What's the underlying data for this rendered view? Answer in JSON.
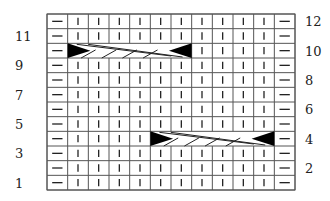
{
  "chart": {
    "title": "",
    "columns": 12,
    "rows": 12,
    "grid": {
      "left": 47,
      "top": 14,
      "right": 295,
      "bottom": 190
    },
    "colors": {
      "line": "#555555",
      "symbol": "#222222",
      "fill": "#000000",
      "background": "#ffffff"
    },
    "symbols": {
      "dash": "purl (horizontal dash)",
      "bar": "knit (vertical bar)",
      "cable": "cable cross"
    },
    "column_pattern": [
      "dash",
      "bar",
      "bar",
      "bar",
      "bar",
      "bar",
      "bar",
      "bar",
      "bar",
      "bar",
      "bar",
      "dash"
    ],
    "left_labels": [
      "1",
      "3",
      "5",
      "7",
      "9",
      "11"
    ],
    "right_labels": [
      "2",
      "4",
      "6",
      "8",
      "10",
      "12"
    ],
    "cables": [
      {
        "row": 10,
        "start_col": 2,
        "end_col": 7,
        "direction": "left-over-right"
      },
      {
        "row": 4,
        "start_col": 6,
        "end_col": 11,
        "direction": "left-over-right"
      }
    ]
  },
  "chart_data": {
    "type": "table",
    "xlabel": "",
    "ylabel": "Row",
    "row_labels_left": [
      1,
      3,
      5,
      7,
      9,
      11
    ],
    "row_labels_right": [
      2,
      4,
      6,
      8,
      10,
      12
    ],
    "rows": [
      {
        "row": 12,
        "cells": [
          "—",
          "|",
          "|",
          "|",
          "|",
          "|",
          "|",
          "|",
          "|",
          "|",
          "|",
          "—"
        ]
      },
      {
        "row": 11,
        "cells": [
          "—",
          "|",
          "|",
          "|",
          "|",
          "|",
          "|",
          "|",
          "|",
          "|",
          "|",
          "—"
        ]
      },
      {
        "row": 10,
        "cells": [
          "—",
          "cable6",
          "cable6",
          "cable6",
          "cable6",
          "cable6",
          "cable6",
          "|",
          "|",
          "|",
          "|",
          "—"
        ]
      },
      {
        "row": 9,
        "cells": [
          "—",
          "|",
          "|",
          "|",
          "|",
          "|",
          "|",
          "|",
          "|",
          "|",
          "|",
          "—"
        ]
      },
      {
        "row": 8,
        "cells": [
          "—",
          "|",
          "|",
          "|",
          "|",
          "|",
          "|",
          "|",
          "|",
          "|",
          "|",
          "—"
        ]
      },
      {
        "row": 7,
        "cells": [
          "—",
          "|",
          "|",
          "|",
          "|",
          "|",
          "|",
          "|",
          "|",
          "|",
          "|",
          "—"
        ]
      },
      {
        "row": 6,
        "cells": [
          "—",
          "|",
          "|",
          "|",
          "|",
          "|",
          "|",
          "|",
          "|",
          "|",
          "|",
          "—"
        ]
      },
      {
        "row": 5,
        "cells": [
          "—",
          "|",
          "|",
          "|",
          "|",
          "|",
          "|",
          "|",
          "|",
          "|",
          "|",
          "—"
        ]
      },
      {
        "row": 4,
        "cells": [
          "—",
          "|",
          "|",
          "|",
          "|",
          "cable6",
          "cable6",
          "cable6",
          "cable6",
          "cable6",
          "cable6",
          "—"
        ]
      },
      {
        "row": 3,
        "cells": [
          "—",
          "|",
          "|",
          "|",
          "|",
          "|",
          "|",
          "|",
          "|",
          "|",
          "|",
          "—"
        ]
      },
      {
        "row": 2,
        "cells": [
          "—",
          "|",
          "|",
          "|",
          "|",
          "|",
          "|",
          "|",
          "|",
          "|",
          "|",
          "—"
        ]
      },
      {
        "row": 1,
        "cells": [
          "—",
          "|",
          "|",
          "|",
          "|",
          "|",
          "|",
          "|",
          "|",
          "|",
          "|",
          "—"
        ]
      }
    ],
    "legend": {
      "—": "purl",
      "|": "knit",
      "cable6": "6-stitch cable cross"
    },
    "grid": true
  }
}
